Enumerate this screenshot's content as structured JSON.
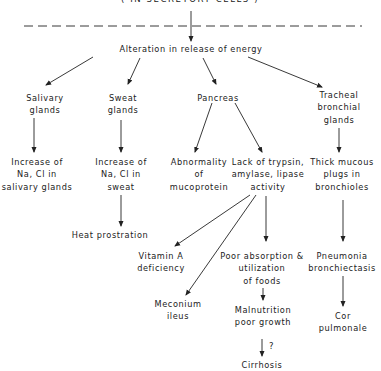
{
  "header": {
    "title": "( IN SECRETORY CELLS )"
  },
  "root": {
    "label": "Alteration in release of energy"
  },
  "nodes": {
    "salivary_glands": [
      "Salivary",
      "glands"
    ],
    "sweat_glands": [
      "Sweat",
      "glands"
    ],
    "pancreas": [
      "Pancreas"
    ],
    "tracheal_glands": [
      "Tracheal",
      "bronchial",
      "glands"
    ],
    "salivary_nacl": [
      "Increase of",
      "Na, Cl in",
      "salivary glands"
    ],
    "sweat_nacl": [
      "Increase of",
      "Na, Cl in",
      "sweat"
    ],
    "mucoprotein": [
      "Abnormality",
      "of",
      "mucoprotein"
    ],
    "enzyme_lack": [
      "Lack of trypsin,",
      "amylase, lipase",
      "activity"
    ],
    "mucous_plugs": [
      "Thick mucous",
      "plugs in",
      "bronchioles"
    ],
    "heat_prostration": [
      "Heat prostration"
    ],
    "vitamin_a": [
      "Vitamin A",
      "deficiency"
    ],
    "poor_absorption": [
      "Poor absorption &",
      "utilization",
      "of foods"
    ],
    "pneumonia": [
      "Pneumonia",
      "bronchiectasis"
    ],
    "meconium": [
      "Meconium",
      "ileus"
    ],
    "malnutrition": [
      "Malnutrition",
      "poor growth"
    ],
    "cor_pulmonale": [
      "Cor",
      "pulmonale"
    ],
    "cirrhosis": [
      "Cirrhosis"
    ]
  },
  "annotations": {
    "uncertain_link": "?"
  },
  "colors": {
    "ink": "#222222",
    "background": "#ffffff"
  }
}
